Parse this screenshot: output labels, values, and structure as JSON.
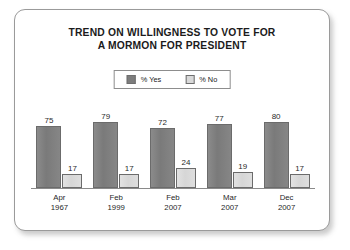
{
  "chart_data": {
    "type": "bar",
    "title": "TREND ON WILLINGNESS TO VOTE FOR A MORMON FOR PRESIDENT",
    "title_lines": [
      "TREND ON WILLINGNESS TO VOTE FOR",
      "A MORMON FOR PRESIDENT"
    ],
    "categories": [
      "Apr 1967",
      "Feb 1999",
      "Feb 2007",
      "Mar 2007",
      "Dec 2007"
    ],
    "category_lines": [
      {
        "month": "Apr",
        "year": "1967"
      },
      {
        "month": "Feb",
        "year": "1999"
      },
      {
        "month": "Feb",
        "year": "2007"
      },
      {
        "month": "Mar",
        "year": "2007"
      },
      {
        "month": "Dec",
        "year": "2007"
      }
    ],
    "series": [
      {
        "name": "% Yes",
        "color": "#7d7d7d",
        "values": [
          75,
          79,
          72,
          77,
          80
        ]
      },
      {
        "name": "% No",
        "color": "#d9d9d9",
        "values": [
          17,
          17,
          24,
          19,
          17
        ]
      }
    ],
    "xlabel": "",
    "ylabel": "",
    "ylim": [
      0,
      100
    ],
    "grid": false,
    "legend_position": "top-center",
    "value_labels": true
  },
  "legend": {
    "entries": [
      {
        "label": "% Yes",
        "swatch": "dark-gray-swatch"
      },
      {
        "label": "% No",
        "swatch": "light-gray-swatch"
      }
    ]
  },
  "style": {
    "card_border": "#9a9a9a",
    "axis_color": "#8a8a8a",
    "text_color": "#1b1b1b",
    "background": "#ffffff"
  }
}
